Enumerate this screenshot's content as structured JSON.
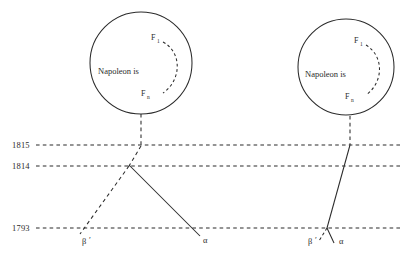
{
  "figure": {
    "width": 412,
    "height": 260,
    "background": "#ffffff",
    "ink_color": "#2b2b2b"
  },
  "timeline": {
    "axis_labels": [
      {
        "id": "y1815",
        "text": "1815",
        "y": 145
      },
      {
        "id": "y1814",
        "text": "1814",
        "y": 166
      },
      {
        "id": "y1793",
        "text": "1793",
        "y": 228
      }
    ]
  },
  "circles": [
    {
      "id": "left-circle",
      "center_x": 141,
      "center_y": 63,
      "radius": 51,
      "body_text": "Napoleon is",
      "top_node": {
        "base": "F",
        "sub": "1"
      },
      "bottom_node": {
        "base": "F",
        "sub": "n"
      }
    },
    {
      "id": "right-circle",
      "center_x": 346,
      "center_y": 67,
      "radius": 48,
      "body_text": "Napoleon is",
      "top_node": {
        "base": "F",
        "sub": "1"
      },
      "bottom_node": {
        "base": "F",
        "sub": "n"
      }
    }
  ],
  "branch_labels": {
    "left": [
      {
        "id": "left-beta",
        "text": "β",
        "prime": "′",
        "x": 86,
        "y": 241
      },
      {
        "id": "left-alpha",
        "text": "α",
        "prime": "",
        "x": 205,
        "y": 240
      }
    ],
    "right": [
      {
        "id": "right-beta",
        "text": "β",
        "prime": "′",
        "x": 312,
        "y": 241
      },
      {
        "id": "right-alpha",
        "text": "α",
        "prime": "",
        "x": 343,
        "y": 241
      }
    ]
  }
}
